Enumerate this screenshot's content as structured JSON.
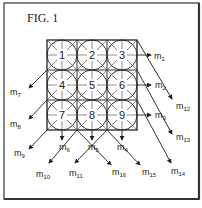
{
  "figure": {
    "title": "FIG. 1",
    "grid": {
      "rows": 3,
      "cols": 3,
      "cells": [
        "1",
        "2",
        "3",
        "4",
        "5",
        "6",
        "7",
        "8",
        "9"
      ]
    },
    "outputs": [
      {
        "id": "m1",
        "base": "m",
        "sub": "1"
      },
      {
        "id": "m2",
        "base": "m",
        "sub": "2"
      },
      {
        "id": "m3",
        "base": "m",
        "sub": "3"
      },
      {
        "id": "m4",
        "base": "m",
        "sub": "4"
      },
      {
        "id": "m5",
        "base": "m",
        "sub": "5"
      },
      {
        "id": "m6",
        "base": "m",
        "sub": "6"
      },
      {
        "id": "m7",
        "base": "m",
        "sub": "7"
      },
      {
        "id": "m8",
        "base": "m",
        "sub": "8"
      },
      {
        "id": "m9",
        "base": "m",
        "sub": "9"
      },
      {
        "id": "m10",
        "base": "m",
        "sub": "10"
      },
      {
        "id": "m11",
        "base": "m",
        "sub": "11"
      },
      {
        "id": "m12",
        "base": "m",
        "sub": "12"
      },
      {
        "id": "m13",
        "base": "m",
        "sub": "13"
      },
      {
        "id": "m14",
        "base": "m",
        "sub": "14"
      },
      {
        "id": "m15",
        "base": "m",
        "sub": "15"
      },
      {
        "id": "m16",
        "base": "m",
        "sub": "16"
      }
    ]
  }
}
